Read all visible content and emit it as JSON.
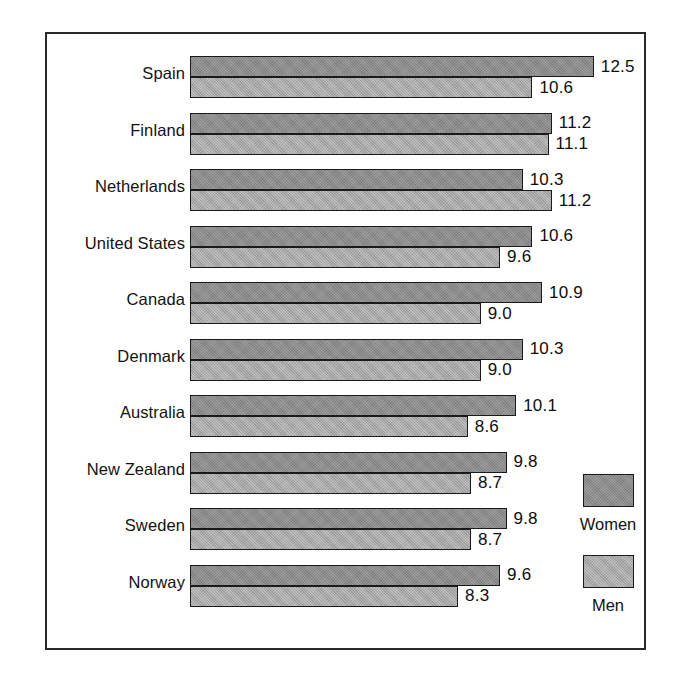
{
  "chart_data": {
    "type": "bar",
    "orientation": "horizontal",
    "title": "",
    "subtitle": "",
    "xlabel": "",
    "ylabel": "",
    "grid": false,
    "legend_position": "right",
    "axis_min": 0,
    "axis_max": 12.5,
    "categories": [
      "Spain",
      "Finland",
      "Netherlands",
      "United States",
      "Canada",
      "Denmark",
      "Australia",
      "New Zealand",
      "Sweden",
      "Norway"
    ],
    "series": [
      {
        "name": "Women",
        "color": "#8b8b8b",
        "values": [
          12.5,
          11.2,
          10.3,
          10.6,
          10.9,
          10.3,
          10.1,
          9.8,
          9.8,
          9.6
        ],
        "labels": [
          "12.5",
          "11.2",
          "10.3",
          "10.6",
          "10.9",
          "10.3",
          "10.1",
          "9.8",
          "9.8",
          "9.6"
        ]
      },
      {
        "name": "Men",
        "color": "#a5a5a5",
        "values": [
          10.6,
          11.1,
          11.2,
          9.6,
          9.0,
          9.0,
          8.6,
          8.7,
          8.7,
          8.3
        ],
        "labels": [
          "10.6",
          "11.1",
          "11.2",
          "9.6",
          "9.0",
          "9.0",
          "8.6",
          "8.7",
          "8.7",
          "8.3"
        ]
      }
    ]
  },
  "legend": {
    "entries": [
      {
        "label": "Women",
        "color": "#8b8b8b"
      },
      {
        "label": "Men",
        "color": "#a5a5a5"
      }
    ]
  },
  "frame": {
    "border_color": "#2a2a2a",
    "background": "#ffffff"
  }
}
